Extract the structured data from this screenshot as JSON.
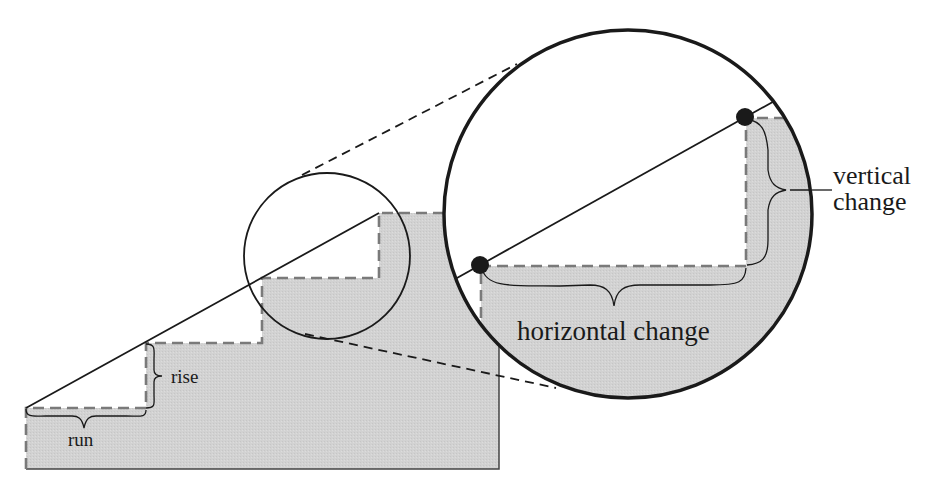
{
  "diagram": {
    "colors": {
      "fill_gray": "#d4d4d4",
      "line": "#1a1a1a",
      "dash_gray": "#7a7a7a",
      "background": "#ffffff"
    },
    "labels": {
      "rise": "rise",
      "run": "run",
      "vertical_change_line1": "vertical",
      "vertical_change_line2": "change",
      "horizontal_change": "horizontal change"
    },
    "elements": {
      "staircase": {
        "steps": 3,
        "base_y": 469,
        "left_x": 26,
        "right_x": 499
      },
      "slope_line": {
        "from": [
          26,
          408
        ],
        "to": [
          379,
          213
        ]
      },
      "small_circle": {
        "cx": 327,
        "cy": 256,
        "r": 83
      },
      "magnified_circle": {
        "cx": 628,
        "cy": 214,
        "r": 185
      },
      "points": [
        [
          480,
          265
        ],
        [
          745,
          117
        ]
      ]
    }
  }
}
